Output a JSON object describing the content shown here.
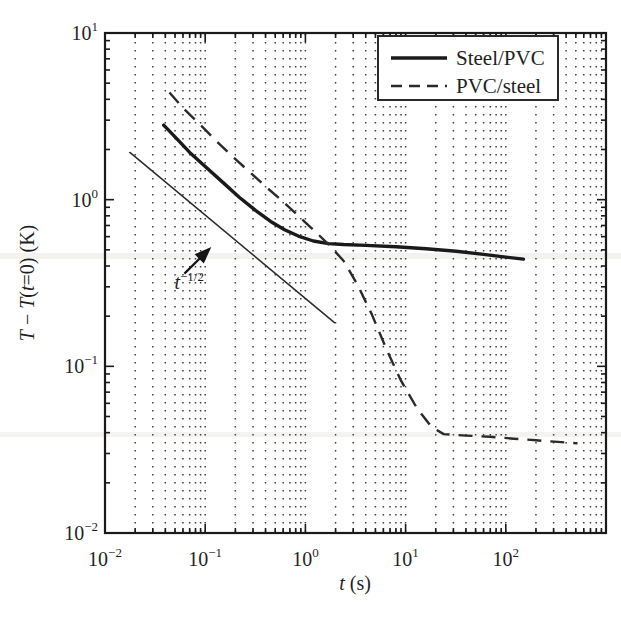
{
  "chart_data": {
    "type": "line",
    "title": "",
    "xlabel": "t (s)",
    "ylabel": "T − T(t=0) (K)",
    "xscale": "log",
    "yscale": "log",
    "xlim": [
      0.01,
      1000
    ],
    "ylim": [
      0.01,
      10
    ],
    "grid": "minor-dotted-vertical",
    "legend_position": "top-right",
    "xticks": [
      {
        "value": 0.01,
        "label_mantissa": "10",
        "label_exponent": "−2"
      },
      {
        "value": 0.1,
        "label_mantissa": "10",
        "label_exponent": "−1"
      },
      {
        "value": 1,
        "label_mantissa": "10",
        "label_exponent": "0"
      },
      {
        "value": 10,
        "label_mantissa": "10",
        "label_exponent": "1"
      },
      {
        "value": 100,
        "label_mantissa": "10",
        "label_exponent": "2"
      }
    ],
    "yticks": [
      {
        "value": 10,
        "label_mantissa": "10",
        "label_exponent": "1"
      },
      {
        "value": 1,
        "label_mantissa": "10",
        "label_exponent": "0"
      },
      {
        "value": 0.1,
        "label_mantissa": "10",
        "label_exponent": "−1"
      },
      {
        "value": 0.01,
        "label_mantissa": "10",
        "label_exponent": "−2"
      }
    ],
    "series": [
      {
        "name": "Steel/PVC",
        "style": "solid",
        "width": 3.4,
        "color": "#1a1a1a",
        "points": [
          [
            0.0385,
            2.8
          ],
          [
            0.05,
            2.38
          ],
          [
            0.07,
            1.92
          ],
          [
            0.1,
            1.58
          ],
          [
            0.15,
            1.27
          ],
          [
            0.22,
            1.03
          ],
          [
            0.32,
            0.86
          ],
          [
            0.45,
            0.74
          ],
          [
            0.62,
            0.66
          ],
          [
            0.85,
            0.605
          ],
          [
            1.2,
            0.565
          ],
          [
            1.7,
            0.545
          ],
          [
            2.4,
            0.538
          ],
          [
            4.0,
            0.532
          ],
          [
            8.0,
            0.522
          ],
          [
            16.0,
            0.508
          ],
          [
            32.0,
            0.49
          ],
          [
            60.0,
            0.47
          ],
          [
            100.0,
            0.452
          ],
          [
            150.0,
            0.44
          ]
        ]
      },
      {
        "name": "PVC/steel",
        "style": "dashed",
        "width": 2.4,
        "color": "#2a2a2a",
        "dash": "14,9",
        "points": [
          [
            0.044,
            4.4
          ],
          [
            0.06,
            3.55
          ],
          [
            0.09,
            2.8
          ],
          [
            0.13,
            2.24
          ],
          [
            0.19,
            1.8
          ],
          [
            0.28,
            1.46
          ],
          [
            0.4,
            1.2
          ],
          [
            0.58,
            0.99
          ],
          [
            0.85,
            0.8
          ],
          [
            1.2,
            0.66
          ],
          [
            1.7,
            0.54
          ],
          [
            2.4,
            0.43
          ],
          [
            3.3,
            0.31
          ],
          [
            4.6,
            0.205
          ],
          [
            6.5,
            0.125
          ],
          [
            9.0,
            0.082
          ],
          [
            13.0,
            0.056
          ],
          [
            18.0,
            0.0435
          ],
          [
            24.0,
            0.0392
          ],
          [
            40.0,
            0.0384
          ],
          [
            70.0,
            0.0378
          ],
          [
            120.0,
            0.0368
          ],
          [
            200.0,
            0.036
          ],
          [
            330.0,
            0.0352
          ],
          [
            520.0,
            0.0345
          ]
        ]
      },
      {
        "name": "t^-1/2 reference",
        "style": "solid-thin",
        "width": 1.5,
        "color": "#2a2a2a",
        "slope": -0.5,
        "points": [
          [
            0.0177,
            1.92
          ],
          [
            1.95,
            0.183
          ]
        ]
      }
    ],
    "annotations": [
      {
        "name": "power-law-label",
        "text_base": "t",
        "text_exponent": "−1/2",
        "x": 0.068,
        "y": 0.29,
        "arrow_from": [
          0.062,
          0.36
        ],
        "arrow_to": [
          0.115,
          0.52
        ]
      }
    ],
    "legend": {
      "entries": [
        {
          "label": "Steel/PVC",
          "style": "solid"
        },
        {
          "label": "PVC/steel",
          "style": "dashed"
        }
      ]
    }
  }
}
